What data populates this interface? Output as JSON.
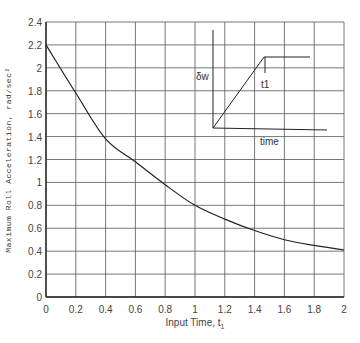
{
  "chart_data": {
    "type": "line",
    "title": "",
    "xlabel": "Input Time, t1",
    "ylabel": "Maximum Roll Acceleration,  rad/sec²",
    "xlim": [
      0,
      2
    ],
    "ylim": [
      0,
      2.4
    ],
    "grid": true,
    "x_ticks": [
      "0",
      "0.2",
      "0.4",
      "0.6",
      "0.8",
      "1",
      "1.2",
      "1.4",
      "1.6",
      "1.8",
      "2"
    ],
    "y_ticks": [
      "0",
      "0.2",
      "0.4",
      "0.6",
      "0.8",
      "1",
      "1.2",
      "1.4",
      "1.6",
      "1.8",
      "2",
      "2.2",
      "2.4"
    ],
    "series": [
      {
        "name": "Maximum Roll Acceleration",
        "x": [
          0,
          0.2,
          0.4,
          0.6,
          0.8,
          1.0,
          1.2,
          1.4,
          1.6,
          1.8,
          2.0
        ],
        "y": [
          2.2,
          1.78,
          1.38,
          1.18,
          0.98,
          0.8,
          0.68,
          0.58,
          0.5,
          0.45,
          0.41
        ]
      }
    ],
    "inset": {
      "description": "Ramp-step steering input schematic",
      "y_label": "δw",
      "x_label": "time",
      "marker_label": "t1"
    }
  }
}
